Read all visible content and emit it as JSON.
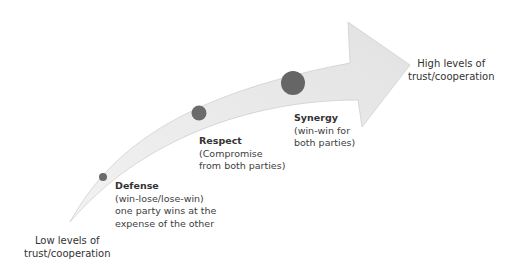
{
  "colors": {
    "arrow_fill": "#e8e8e8",
    "arrow_edge": "#b5b5b5",
    "dot": "#6b6b6b"
  },
  "end_labels": {
    "low": {
      "line1": "Low levels of",
      "line2": "trust/cooperation"
    },
    "high": {
      "line1": "High levels of",
      "line2": "trust/cooperation"
    }
  },
  "stages": [
    {
      "title": "Defense",
      "lines": [
        "(win-lose/lose-win)",
        "one party wins at the",
        "expense of the other"
      ]
    },
    {
      "title": "Respect",
      "lines": [
        "(Compromise",
        "from both parties)"
      ]
    },
    {
      "title": "Synergy",
      "lines": [
        "(win-win for",
        "both parties)"
      ]
    }
  ]
}
